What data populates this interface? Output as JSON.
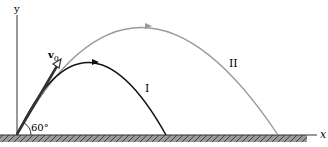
{
  "diagram": {
    "axes": {
      "x_label": "x",
      "y_label": "y"
    },
    "launch": {
      "velocity_label": "v",
      "velocity_subscript": "0",
      "angle_label": "60°"
    },
    "trajectories": [
      {
        "id": "I",
        "label": "I",
        "color": "#111111"
      },
      {
        "id": "II",
        "label": "II",
        "color": "#9a9a9a"
      }
    ],
    "colors": {
      "ground": "#777777",
      "axis": "#333333"
    }
  }
}
